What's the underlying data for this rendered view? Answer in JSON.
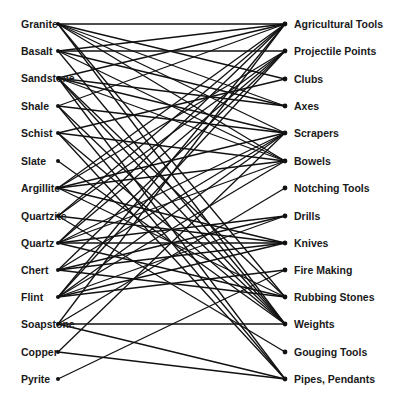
{
  "diagram": {
    "type": "bipartite-network",
    "materials": [
      {
        "label": "Granite",
        "y": 24
      },
      {
        "label": "Basalt",
        "y": 51
      },
      {
        "label": "Sandstone",
        "y": 78
      },
      {
        "label": "Shale",
        "y": 106
      },
      {
        "label": "Schist",
        "y": 133
      },
      {
        "label": "Slate",
        "y": 161
      },
      {
        "label": "Argillite",
        "y": 188
      },
      {
        "label": "Quartzite",
        "y": 216
      },
      {
        "label": "Quartz",
        "y": 243
      },
      {
        "label": "Chert",
        "y": 270
      },
      {
        "label": "Flint",
        "y": 297
      },
      {
        "label": "Soapstone",
        "y": 324
      },
      {
        "label": "Copper",
        "y": 352
      },
      {
        "label": "Pyrite",
        "y": 379
      }
    ],
    "uses": [
      {
        "label": "Agricultural Tools",
        "y": 24
      },
      {
        "label": "Projectile Points",
        "y": 51
      },
      {
        "label": "Clubs",
        "y": 79
      },
      {
        "label": "Axes",
        "y": 106
      },
      {
        "label": "Scrapers",
        "y": 133
      },
      {
        "label": "Bowels",
        "y": 161
      },
      {
        "label": "Notching Tools",
        "y": 188
      },
      {
        "label": "Drills",
        "y": 216
      },
      {
        "label": "Knives",
        "y": 243
      },
      {
        "label": "Fire Making",
        "y": 270
      },
      {
        "label": "Rubbing Stones",
        "y": 297
      },
      {
        "label": "Weights",
        "y": 324
      },
      {
        "label": "Gouging Tools",
        "y": 352
      },
      {
        "label": "Pipes, Pendants",
        "y": 379
      }
    ],
    "edges": [
      [
        0,
        0
      ],
      [
        0,
        2
      ],
      [
        0,
        3
      ],
      [
        0,
        4
      ],
      [
        0,
        5
      ],
      [
        0,
        10
      ],
      [
        0,
        11
      ],
      [
        1,
        0
      ],
      [
        1,
        1
      ],
      [
        1,
        3
      ],
      [
        1,
        5
      ],
      [
        1,
        11
      ],
      [
        2,
        0
      ],
      [
        2,
        3
      ],
      [
        2,
        4
      ],
      [
        2,
        5
      ],
      [
        2,
        10
      ],
      [
        2,
        11
      ],
      [
        2,
        13
      ],
      [
        3,
        0
      ],
      [
        3,
        4
      ],
      [
        3,
        11
      ],
      [
        3,
        13
      ],
      [
        4,
        2
      ],
      [
        4,
        5
      ],
      [
        4,
        11
      ],
      [
        4,
        13
      ],
      [
        5,
        11
      ],
      [
        6,
        0
      ],
      [
        6,
        1
      ],
      [
        6,
        4
      ],
      [
        6,
        5
      ],
      [
        6,
        8
      ],
      [
        6,
        10
      ],
      [
        7,
        0
      ],
      [
        7,
        1
      ],
      [
        7,
        8
      ],
      [
        7,
        12
      ],
      [
        8,
        0
      ],
      [
        8,
        1
      ],
      [
        8,
        4
      ],
      [
        8,
        5
      ],
      [
        8,
        7
      ],
      [
        8,
        8
      ],
      [
        8,
        10
      ],
      [
        9,
        1
      ],
      [
        9,
        4
      ],
      [
        9,
        7
      ],
      [
        9,
        8
      ],
      [
        9,
        10
      ],
      [
        10,
        0
      ],
      [
        10,
        1
      ],
      [
        10,
        4
      ],
      [
        10,
        5
      ],
      [
        10,
        7
      ],
      [
        10,
        8
      ],
      [
        10,
        9
      ],
      [
        11,
        0
      ],
      [
        11,
        6
      ],
      [
        11,
        11
      ],
      [
        11,
        13
      ],
      [
        12,
        4
      ],
      [
        12,
        13
      ],
      [
        13,
        9
      ]
    ],
    "left_dot_x": 58,
    "right_dot_x": 285
  }
}
